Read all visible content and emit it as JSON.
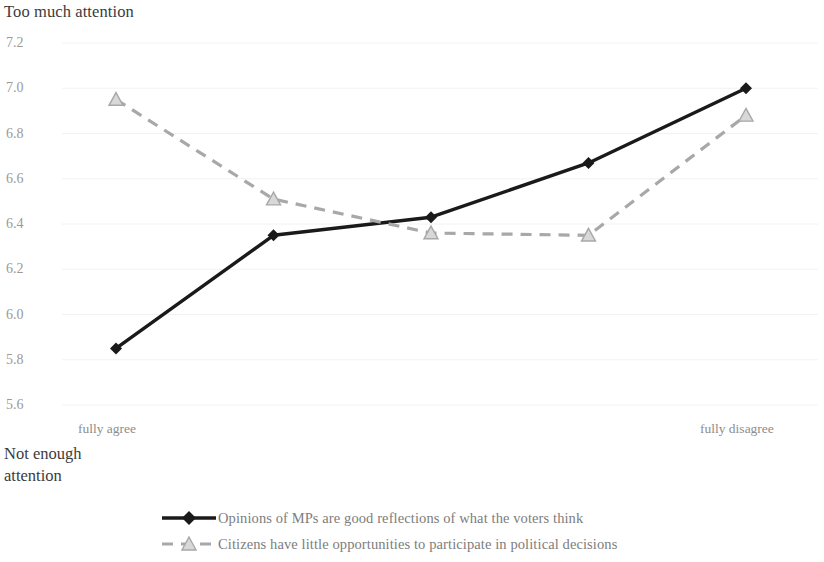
{
  "axes": {
    "top_label": "Too much attention",
    "bottom_label_line1": "Not enough",
    "bottom_label_line2": "attention",
    "x_left_label": "fully agree",
    "x_right_label": "fully disagree",
    "y_ticks": [
      "7.2",
      "7.0",
      "6.8",
      "6.6",
      "6.4",
      "6.2",
      "6.0",
      "5.8",
      "5.6"
    ]
  },
  "legend": {
    "items": [
      {
        "label": "Opinions of MPs are good reflections of what the voters think",
        "style": "solid-diamond",
        "color": "#1a1a1a"
      },
      {
        "label": "Citizens have little opportunities to participate in political decisions",
        "style": "dashed-triangle",
        "color": "#a8a8a8"
      }
    ]
  },
  "chart_data": {
    "type": "line",
    "title": "",
    "xlabel": "",
    "ylabel": "Too much attention / Not enough attention",
    "categories": [
      "fully agree",
      "",
      "",
      "",
      "fully disagree"
    ],
    "x": [
      1,
      2,
      3,
      4,
      5
    ],
    "ylim": [
      5.6,
      7.2
    ],
    "ytick_step": 0.2,
    "grid": true,
    "grid_color": "#f2f2f2",
    "legend_position": "bottom",
    "series": [
      {
        "name": "Opinions of MPs are good reflections of what the voters think",
        "values": [
          5.85,
          6.35,
          6.43,
          6.67,
          7.0
        ],
        "color": "#1a1a1a",
        "line_style": "solid",
        "marker": "diamond"
      },
      {
        "name": "Citizens have little opportunities to participate in political decisions",
        "values": [
          6.95,
          6.51,
          6.36,
          6.35,
          6.88
        ],
        "color": "#a8a8a8",
        "line_style": "dashed",
        "marker": "triangle"
      }
    ]
  }
}
